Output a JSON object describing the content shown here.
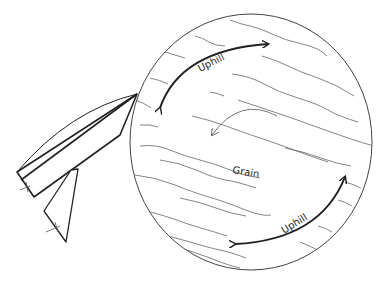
{
  "diagram": {
    "labels": {
      "uphill_top": "Uphill",
      "grain": "Grain",
      "uphill_bottom": "Uphill"
    },
    "colors": {
      "stroke": "#222222",
      "grain_lines": "#555555",
      "background": "#ffffff"
    }
  }
}
